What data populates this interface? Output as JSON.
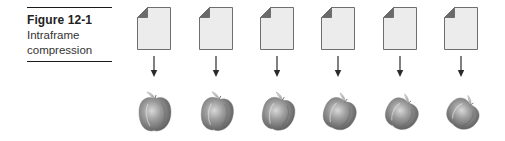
{
  "figure": {
    "number": "Figure 12-1",
    "title": "Intraframe compression",
    "title_lines": [
      "Intraframe",
      "compression"
    ]
  },
  "frames": [
    {
      "index": 1,
      "source_icon": "document-icon",
      "result_icon": "apple-icon",
      "rotation_deg": 0,
      "squash": 1.0
    },
    {
      "index": 2,
      "source_icon": "document-icon",
      "result_icon": "apple-icon",
      "rotation_deg": 8,
      "squash": 0.97
    },
    {
      "index": 3,
      "source_icon": "document-icon",
      "result_icon": "apple-icon",
      "rotation_deg": 16,
      "squash": 0.94
    },
    {
      "index": 4,
      "source_icon": "document-icon",
      "result_icon": "apple-icon",
      "rotation_deg": 24,
      "squash": 0.9
    },
    {
      "index": 5,
      "source_icon": "document-icon",
      "result_icon": "apple-icon",
      "rotation_deg": 32,
      "squash": 0.86
    },
    {
      "index": 6,
      "source_icon": "document-icon",
      "result_icon": "apple-icon",
      "rotation_deg": 40,
      "squash": 0.82
    }
  ],
  "colors": {
    "rule": "#1a1a1a",
    "doc_fill": "#ececec",
    "doc_stroke": "#6e6e6e",
    "doc_fold": "#6a6a6a",
    "arrow": "#2a2a2a",
    "apple_dark": "#6f6f6f",
    "apple_light": "#c9c9c9"
  }
}
